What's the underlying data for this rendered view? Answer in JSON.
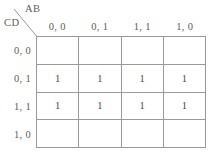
{
  "diagram": {
    "type": "karnaugh-map",
    "variables_top_label": "AB",
    "variables_side_label": "CD",
    "column_headers": [
      "0, 0",
      "0, 1",
      "1, 1",
      "1, 0"
    ],
    "row_headers": [
      "0, 0",
      "0, 1",
      "1, 1",
      "1, 0"
    ],
    "cells": [
      [
        "",
        "",
        "",
        ""
      ],
      [
        "1",
        "1",
        "1",
        "1"
      ],
      [
        "1",
        "1",
        "1",
        "1"
      ],
      [
        "",
        "",
        "",
        ""
      ]
    ],
    "colors": {
      "grid_line": "#9a9a9a",
      "text": "#5d5d5d",
      "cell_text": "#4a4a4a",
      "background": "#ffffff"
    }
  }
}
